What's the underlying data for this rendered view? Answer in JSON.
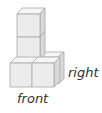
{
  "diagram": {
    "type": "isometric-cube-arrangement",
    "cube_count_visible": 5,
    "colors": {
      "front_face": "#ececec",
      "top_face": "#f6f6f6",
      "side_face": "#d9d9d9",
      "edge": "#a8a8a8"
    },
    "labels": {
      "right": "right",
      "front": "front"
    }
  }
}
